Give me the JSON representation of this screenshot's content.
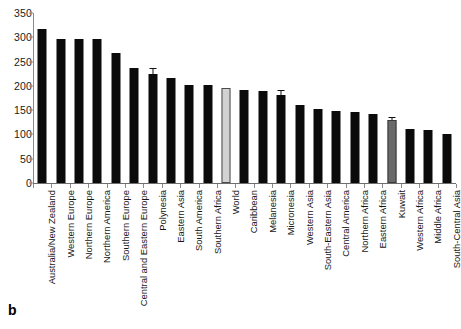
{
  "panel": {
    "label": "b"
  },
  "chart_data": {
    "type": "bar",
    "title": "",
    "subtitle": "",
    "xlabel": "",
    "ylabel": "",
    "ylim": [
      0,
      350
    ],
    "ytick_step": 50,
    "yticks": [
      "0",
      "50",
      "100",
      "150",
      "200",
      "250",
      "300",
      "350"
    ],
    "grid": false,
    "legend": "none",
    "orientation": "vertical",
    "categories": [
      "Australia/New Zealand",
      "Western Europe",
      "Northern Europe",
      "Northern America",
      "Southern Europe",
      "Central and Eastern Europe",
      "Polynesia",
      "Eastern Asia",
      "South America",
      "Southern Africa",
      "World",
      "Caribbean",
      "Melanesia",
      "Micronesia",
      "Western Asia",
      "South-Eastern Asia",
      "Central America",
      "Northern Africa",
      "Eastern Africa",
      "Kuwait",
      "Western Africa",
      "Middle Africa",
      "South-Central Asia"
    ],
    "values": [
      318,
      297,
      297,
      297,
      268,
      236,
      224,
      217,
      201,
      201,
      196,
      191,
      189,
      181,
      160,
      152,
      148,
      147,
      143,
      129,
      112,
      110,
      100
    ],
    "errors": [
      null,
      null,
      null,
      null,
      null,
      null,
      10,
      null,
      null,
      null,
      null,
      null,
      null,
      9,
      null,
      null,
      null,
      null,
      null,
      5,
      null,
      null,
      null
    ],
    "bar_styles": [
      "dark",
      "dark",
      "dark",
      "dark",
      "dark",
      "dark",
      "dark",
      "dark",
      "dark",
      "dark",
      "light",
      "dark",
      "dark",
      "dark",
      "dark",
      "dark",
      "dark",
      "dark",
      "dark",
      "mid",
      "dark",
      "dark",
      "dark"
    ],
    "colors": {
      "dark": "#0b0b0b",
      "light": "#d2d2d2",
      "mid": "#6a6a6a",
      "axis": "#8a8a8a",
      "text": "#151515",
      "background": "#ffffff"
    }
  }
}
